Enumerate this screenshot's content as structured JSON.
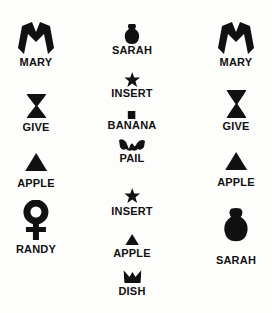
{
  "diagram": {
    "type": "lexigram-sentences",
    "columns": [
      {
        "name": "left",
        "items": [
          {
            "label": "MARY",
            "icon": "m-shape-icon"
          },
          {
            "label": "GIVE",
            "icon": "hourglass-icon"
          },
          {
            "label": "APPLE",
            "icon": "triangle-icon"
          },
          {
            "label": "RANDY",
            "icon": "venus-symbol-icon"
          }
        ]
      },
      {
        "name": "middle",
        "items": [
          {
            "label": "SARAH",
            "icon": "blob-icon"
          },
          {
            "label": "INSERT",
            "icon": "star-icon"
          },
          {
            "label": "BANANA",
            "icon": "square-icon"
          },
          {
            "label": "PAIL",
            "icon": "wave-icon"
          },
          {
            "label": "INSERT",
            "icon": "star-icon"
          },
          {
            "label": "APPLE",
            "icon": "triangle-icon"
          },
          {
            "label": "DISH",
            "icon": "crown-icon"
          }
        ]
      },
      {
        "name": "right",
        "items": [
          {
            "label": "MARY",
            "icon": "m-shape-icon"
          },
          {
            "label": "GIVE",
            "icon": "hourglass-icon"
          },
          {
            "label": "APPLE",
            "icon": "triangle-icon"
          },
          {
            "label": "SARAH",
            "icon": "blob-icon"
          }
        ]
      }
    ]
  },
  "colors": {
    "ink": "#111111",
    "background": "#fdfdfc"
  }
}
